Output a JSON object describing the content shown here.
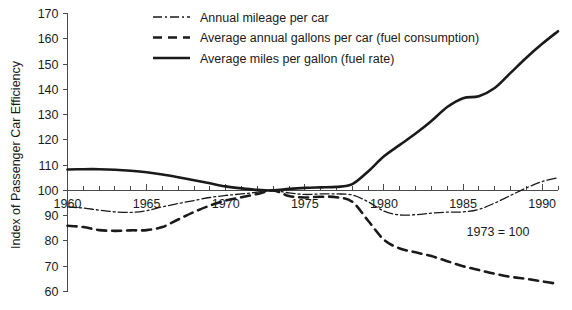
{
  "chart_data": {
    "type": "line",
    "title": "",
    "xlabel": "",
    "ylabel": "Index of Passenger Car Efficiency",
    "note": "1973 = 100",
    "xlim": [
      1960,
      1991
    ],
    "ylim": [
      60,
      170
    ],
    "grid": false,
    "legend_position": "top-center",
    "x_ticks": [
      1960,
      1965,
      1970,
      1975,
      1980,
      1985,
      1990
    ],
    "x_tick_labels": [
      "1960",
      "1965",
      "1970",
      "1975",
      "1980",
      "1985",
      "1990"
    ],
    "x_minor_tick_step": 1,
    "y_ticks": [
      60,
      70,
      80,
      90,
      100,
      110,
      120,
      130,
      140,
      150,
      160,
      170
    ],
    "y_tick_labels": [
      "60",
      "70",
      "80",
      "90",
      "100",
      "110",
      "120",
      "130",
      "140",
      "150",
      "160",
      "170"
    ],
    "series": [
      {
        "name": "Annual mileage per car",
        "style": "dash-dot",
        "color": "#1a1a1a",
        "width": 1.3,
        "dasharray": "9,3,2,3",
        "x": [
          1960,
          1961,
          1962,
          1963,
          1964,
          1965,
          1966,
          1967,
          1968,
          1969,
          1970,
          1971,
          1972,
          1973,
          1974,
          1975,
          1976,
          1977,
          1978,
          1979,
          1980,
          1981,
          1982,
          1983,
          1984,
          1985,
          1986,
          1987,
          1988,
          1989,
          1990,
          1991
        ],
        "values": [
          93.5,
          93.0,
          92.2,
          91.5,
          91.3,
          92.0,
          93.5,
          94.8,
          96.0,
          97.2,
          98.0,
          98.6,
          99.3,
          100.0,
          99.0,
          98.4,
          98.6,
          98.6,
          98.2,
          95.5,
          91.8,
          90.3,
          90.4,
          91.0,
          91.4,
          91.5,
          92.5,
          95.0,
          98.0,
          101.0,
          103.5,
          105.0
        ]
      },
      {
        "name": "Average annual gallons per car (fuel consumption)",
        "style": "dashed",
        "color": "#1a1a1a",
        "width": 2.6,
        "dasharray": "9,6",
        "x": [
          1960,
          1961,
          1962,
          1963,
          1964,
          1965,
          1966,
          1967,
          1968,
          1969,
          1970,
          1971,
          1972,
          1973,
          1974,
          1975,
          1976,
          1977,
          1978,
          1979,
          1980,
          1981,
          1982,
          1983,
          1984,
          1985,
          1986,
          1987,
          1988,
          1989,
          1990,
          1991
        ],
        "values": [
          86.0,
          85.5,
          84.3,
          84.0,
          84.2,
          84.3,
          85.5,
          88.5,
          91.5,
          94.0,
          96.0,
          97.3,
          98.6,
          100.0,
          97.8,
          97.2,
          97.5,
          97.3,
          95.5,
          88.0,
          80.5,
          77.0,
          75.5,
          74.0,
          72.0,
          70.0,
          68.5,
          67.0,
          65.8,
          65.0,
          64.0,
          63.0
        ]
      },
      {
        "name": "Average miles per gallon (fuel rate)",
        "style": "solid",
        "color": "#1a1a1a",
        "width": 2.6,
        "dasharray": "",
        "x": [
          1960,
          1961,
          1962,
          1963,
          1964,
          1965,
          1966,
          1967,
          1968,
          1969,
          1970,
          1971,
          1972,
          1973,
          1974,
          1975,
          1976,
          1977,
          1978,
          1979,
          1980,
          1981,
          1982,
          1983,
          1984,
          1985,
          1986,
          1987,
          1988,
          1989,
          1990,
          1991
        ],
        "values": [
          108.3,
          108.4,
          108.4,
          108.2,
          107.8,
          107.2,
          106.3,
          105.2,
          104.0,
          102.8,
          101.6,
          100.8,
          100.2,
          100.0,
          100.6,
          101.0,
          101.2,
          101.4,
          102.5,
          107.5,
          113.5,
          118.0,
          122.5,
          127.5,
          133.0,
          136.5,
          137.3,
          140.5,
          146.5,
          152.5,
          158.0,
          163.0
        ]
      }
    ]
  },
  "legend": {
    "items": [
      {
        "label": "Annual mileage per car"
      },
      {
        "label": "Average annual gallons per car (fuel consumption)"
      },
      {
        "label": "Average miles per gallon (fuel rate)"
      }
    ]
  }
}
